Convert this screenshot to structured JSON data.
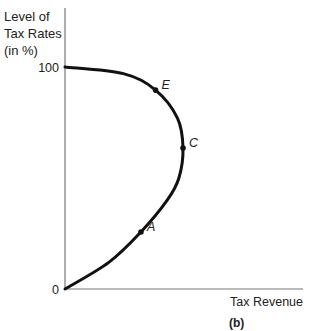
{
  "chart_data": {
    "type": "line",
    "title": "",
    "caption": "(b)",
    "ylabel_lines": [
      "Level of",
      "Tax Rates",
      "(in %)"
    ],
    "xlabel": "Tax Revenue",
    "y_ticks": [
      {
        "value": 0,
        "label": "0"
      },
      {
        "value": 100,
        "label": "100"
      }
    ],
    "xlim": [
      0,
      100
    ],
    "ylim": [
      0,
      100
    ],
    "grid": false,
    "series": [
      {
        "name": "Laffer curve",
        "color": "#111111",
        "points": [
          {
            "x": 0,
            "y": 0
          },
          {
            "x": 30,
            "y": 12
          },
          {
            "x": 52,
            "y": 25.7
          },
          {
            "x": 70,
            "y": 40
          },
          {
            "x": 78,
            "y": 50
          },
          {
            "x": 80.8,
            "y": 63.5
          },
          {
            "x": 77,
            "y": 77
          },
          {
            "x": 62,
            "y": 89.6
          },
          {
            "x": 40,
            "y": 97
          },
          {
            "x": 0,
            "y": 100
          }
        ]
      }
    ],
    "annotations": [
      {
        "label": "A",
        "x": 52,
        "y": 25.7
      },
      {
        "label": "C",
        "x": 80.8,
        "y": 63.5
      },
      {
        "label": "E",
        "x": 62,
        "y": 89.6
      }
    ]
  }
}
